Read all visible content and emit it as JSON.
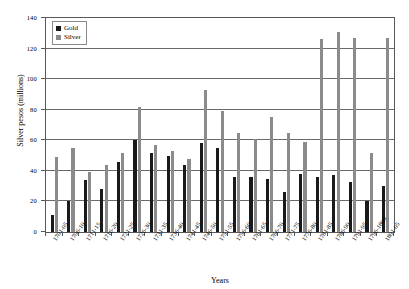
{
  "chart_data": {
    "type": "bar",
    "title": "",
    "xlabel": "Years",
    "ylabel": "Silver pesos (millions)",
    "ylim": [
      0,
      140
    ],
    "ytick_step": 20,
    "yticks": [
      0,
      20,
      40,
      60,
      80,
      100,
      120,
      140
    ],
    "grid": true,
    "legend_position": "top-left",
    "categories": [
      "1701-05",
      "1706-10",
      "1711-15",
      "1716-20",
      "1721-25",
      "1726-30",
      "1731-35",
      "1736-40",
      "1741-45",
      "1746-50",
      "1751-55",
      "1756-60",
      "1761-65",
      "1766-70",
      "1771-75",
      "1776-80",
      "1781-85",
      "1786-90",
      "1791-95",
      "1796-1800",
      "1801-05"
    ],
    "series": [
      {
        "name": "Gold",
        "color": "#1a1a1a",
        "values": [
          11,
          20,
          34,
          28,
          46,
          60,
          52,
          50,
          44,
          58,
          55,
          36,
          36,
          35,
          26,
          38,
          36,
          37,
          33,
          20,
          30
        ]
      },
      {
        "name": "Silver",
        "color": "#8b8b8d",
        "values": [
          49,
          55,
          39,
          44,
          52,
          82,
          57,
          53,
          48,
          93,
          79,
          65,
          61,
          75,
          65,
          59,
          126,
          131,
          127,
          52,
          127
        ]
      }
    ]
  },
  "legend": {
    "items": [
      {
        "label": "Gold",
        "swatch": "gold-swatch-icon"
      },
      {
        "label": "Silver",
        "swatch": "silver-swatch-icon"
      }
    ]
  },
  "axes": {
    "y_title": "Silver pesos (millions)",
    "x_title": "Years"
  }
}
